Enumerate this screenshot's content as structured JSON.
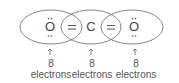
{
  "diagram": {
    "atoms": [
      {
        "symbol": "O",
        "lone_pairs": "top and bottom"
      },
      {
        "symbol": "C"
      },
      {
        "symbol": "O",
        "lone_pairs": "top and bottom"
      }
    ],
    "bonds": [
      "=",
      "="
    ],
    "labels": [
      {
        "count": "8",
        "text": "electrons"
      },
      {
        "count": "8",
        "text": "electrons"
      },
      {
        "count": "8",
        "text": "electrons"
      }
    ],
    "colors": {
      "stroke": "#666666",
      "text": "#444444"
    }
  }
}
